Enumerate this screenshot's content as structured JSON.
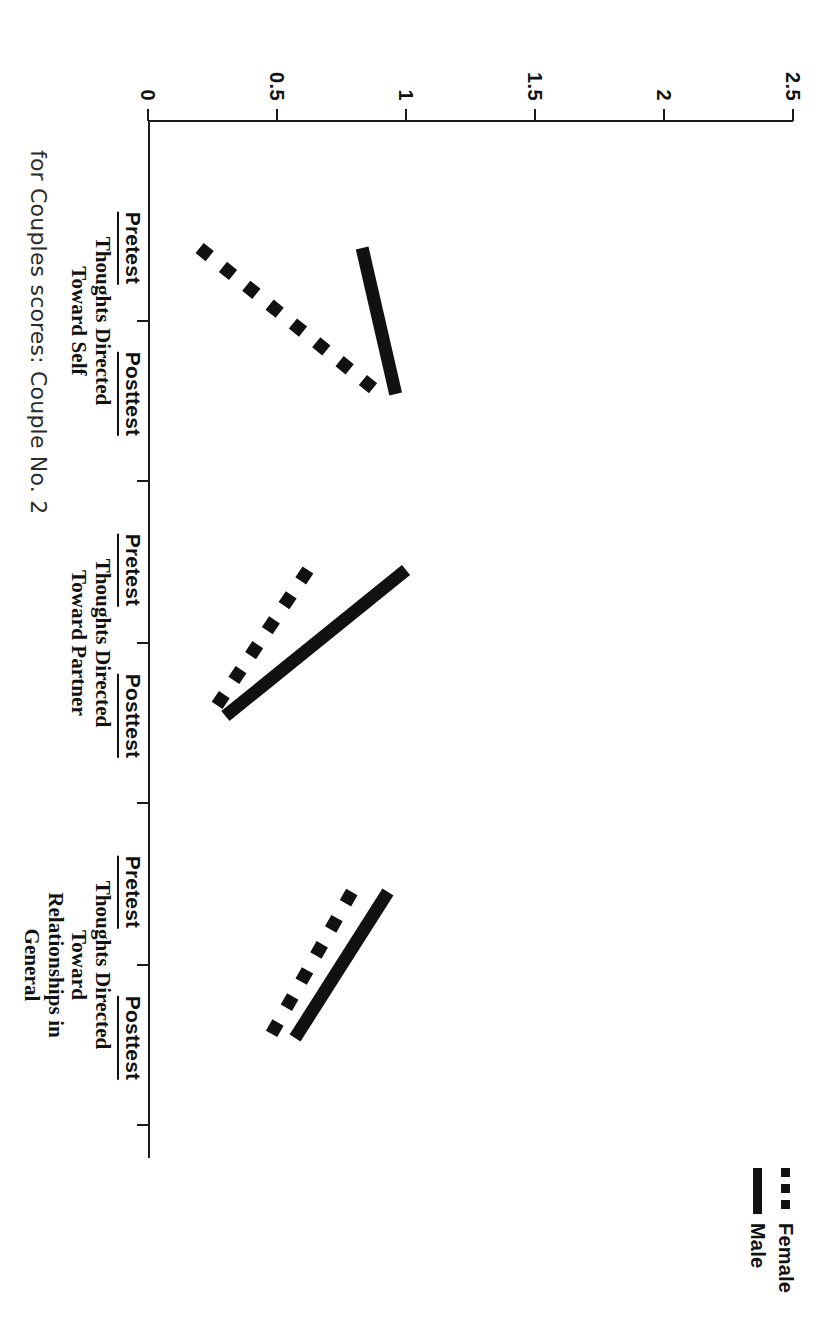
{
  "legend": {
    "position": "top-right",
    "entries": [
      {
        "label": "Female",
        "style": "dotted",
        "swatch_icon": "dotted-line-icon"
      },
      {
        "label": "Male",
        "style": "solid",
        "swatch_icon": "solid-line-icon"
      }
    ]
  },
  "caption": {
    "text": "for Couples scores: Couple No. 2"
  },
  "axes": {
    "value_axis_label": "",
    "value_ticks": [
      "0",
      "0.5",
      "1",
      "1.5",
      "2",
      "2.5"
    ],
    "value_tick_values": [
      0,
      0.5,
      1,
      1.5,
      2,
      2.5
    ],
    "value_min": 0,
    "value_max": 2.5,
    "phase_labels": [
      "Pretest",
      "Posttest"
    ],
    "groups": [
      "Thoughts Directed\nToward Self",
      "Thoughts Directed\nToward Partner",
      "Thoughts Directed Toward\nRelationships in General"
    ]
  },
  "chart_data": {
    "type": "line",
    "title": "",
    "subtitle": "",
    "xlabel": "",
    "ylabel": "",
    "ylim": [
      0,
      2.5
    ],
    "yticks": [
      0,
      0.5,
      1,
      1.5,
      2,
      2.5
    ],
    "ytick_labels": [
      "0",
      "0.5",
      "1",
      "1.5",
      "2",
      "2.5"
    ],
    "grid": false,
    "legend_position": "top-right",
    "orientation": "page-rotated-90",
    "groups": [
      {
        "name": "Thoughts Directed Toward Self",
        "categories": [
          "Pretest",
          "Posttest"
        ]
      },
      {
        "name": "Thoughts Directed Toward Partner",
        "categories": [
          "Pretest",
          "Posttest"
        ]
      },
      {
        "name": "Thoughts Directed Toward Relationships in General",
        "categories": [
          "Pretest",
          "Posttest"
        ]
      }
    ],
    "categories": [
      "Self / Pretest",
      "Self / Posttest",
      "Partner / Pretest",
      "Partner / Posttest",
      "General / Pretest",
      "General / Posttest"
    ],
    "series": [
      {
        "name": "Male",
        "style": "solid",
        "segments": [
          {
            "group": "Thoughts Directed Toward Self",
            "pretest": 0.83,
            "posttest": 0.96
          },
          {
            "group": "Thoughts Directed Toward Partner",
            "pretest": 1.0,
            "posttest": 0.3
          },
          {
            "group": "Thoughts Directed Toward Relationships in General",
            "pretest": 0.93,
            "posttest": 0.57
          }
        ],
        "values": [
          0.83,
          0.96,
          1.0,
          0.3,
          0.93,
          0.57
        ]
      },
      {
        "name": "Female",
        "style": "dotted",
        "segments": [
          {
            "group": "Thoughts Directed Toward Self",
            "pretest": 0.2,
            "posttest": 0.9
          },
          {
            "group": "Thoughts Directed Toward Partner",
            "pretest": 0.62,
            "posttest": 0.24
          },
          {
            "group": "Thoughts Directed Toward Relationships in General",
            "pretest": 0.79,
            "posttest": 0.47
          }
        ],
        "values": [
          0.2,
          0.9,
          0.62,
          0.24,
          0.79,
          0.47
        ]
      }
    ]
  }
}
